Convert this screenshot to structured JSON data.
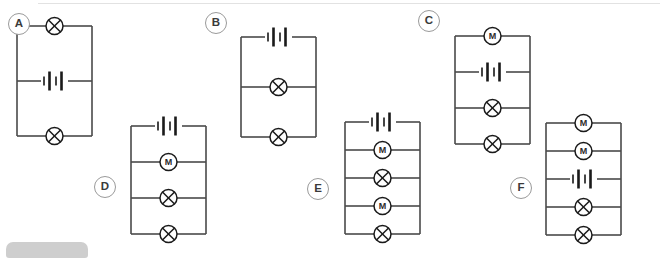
{
  "page": {
    "background_color": "#ffffff",
    "wire_color": "#4a4a4a",
    "symbol_color": "#1a1a1a",
    "label_border_color": "#9a9a9a",
    "label_text_color": "#3a3a3a",
    "top_rule_color": "#e2e2e2",
    "bottom_chip_color": "#bdbdbd"
  },
  "decorations": {
    "top_rule_name": "top-divider-rule",
    "bottom_chip_name": "bottom-ui-chip"
  },
  "symbols": {
    "lamp": {
      "name": "lamp-symbol",
      "glyph": "circle-with-x"
    },
    "motor": {
      "name": "motor-symbol",
      "glyph": "M",
      "letter": "M"
    },
    "battery": {
      "name": "battery-symbol",
      "glyph": "two-cell-battery"
    }
  },
  "circuits": [
    {
      "id": "A",
      "label": "A",
      "label_name": "circuit-label-a",
      "branches": [
        "lamp",
        "battery",
        "lamp"
      ],
      "branch_count": 3,
      "x": 17,
      "y": 26,
      "w": 75,
      "h": 110,
      "label_x": 8,
      "label_y": 13
    },
    {
      "id": "B",
      "label": "B",
      "label_name": "circuit-label-b",
      "branches": [
        "battery",
        "lamp",
        "lamp"
      ],
      "branch_count": 3,
      "x": 241,
      "y": 37,
      "w": 75,
      "h": 100,
      "label_x": 205,
      "label_y": 12
    },
    {
      "id": "C",
      "label": "C",
      "label_name": "circuit-label-c",
      "branches": [
        "motor",
        "battery",
        "lamp",
        "lamp"
      ],
      "branch_count": 4,
      "x": 455,
      "y": 36,
      "w": 75,
      "h": 108,
      "label_x": 418,
      "label_y": 10
    },
    {
      "id": "D",
      "label": "D",
      "label_name": "circuit-label-d",
      "branches": [
        "battery",
        "motor",
        "lamp",
        "lamp"
      ],
      "branch_count": 4,
      "x": 131,
      "y": 126,
      "w": 75,
      "h": 108,
      "label_x": 94,
      "label_y": 176
    },
    {
      "id": "E",
      "label": "E",
      "label_name": "circuit-label-e",
      "branches": [
        "battery",
        "motor",
        "lamp",
        "motor",
        "lamp"
      ],
      "branch_count": 5,
      "x": 345,
      "y": 122,
      "w": 75,
      "h": 112,
      "label_x": 307,
      "label_y": 178
    },
    {
      "id": "F",
      "label": "F",
      "label_name": "circuit-label-f",
      "branches": [
        "motor",
        "motor",
        "battery",
        "lamp",
        "lamp"
      ],
      "branch_count": 5,
      "x": 546,
      "y": 123,
      "w": 75,
      "h": 112,
      "label_x": 510,
      "label_y": 177
    }
  ]
}
